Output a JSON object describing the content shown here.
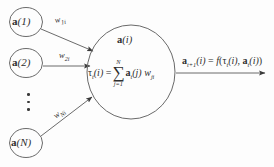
{
  "diagram": {
    "stroke_color": "#555555",
    "text_color": "#2e2e2e",
    "background": "#fdfdfd",
    "input_nodes": [
      {
        "id": "node-1",
        "label_prefix": "a",
        "label_arg": "(1)",
        "cx": 26,
        "cy": 22,
        "r": 16
      },
      {
        "id": "node-2",
        "label_prefix": "a",
        "label_arg": "(2)",
        "cx": 26,
        "cy": 63,
        "r": 16
      },
      {
        "id": "node-n",
        "label_prefix": "a",
        "label_arg": "(N)",
        "cx": 26,
        "cy": 143,
        "r": 16
      }
    ],
    "weights": [
      {
        "id": "weight-1i",
        "base": "w",
        "sub": "1i",
        "x": 58,
        "y": 22
      },
      {
        "id": "weight-2i",
        "base": "w",
        "sub": "2i",
        "x": 60,
        "y": 56
      },
      {
        "id": "weight-Ni",
        "base": "w",
        "sub": "Ni",
        "x": 58,
        "y": 110
      }
    ],
    "ellipsis_count": 3,
    "cell": {
      "cx": 131,
      "cy": 72,
      "rx": 44,
      "ry": 47,
      "top_label_prefix": "a",
      "top_label_arg": "(i)",
      "formula": {
        "lhs_tau": "τ",
        "lhs_sub": "t",
        "lhs_arg": "(i)",
        "equals": "=",
        "sigma": "∑",
        "sigma_top": "N",
        "sigma_bottom": "j=1",
        "term_a": "a",
        "term_a_sub": "t",
        "term_a_arg": "(j)",
        "term_w": "w",
        "term_w_sub": "ji"
      }
    },
    "output": {
      "a_symbol": "a",
      "a_sub": "t+1",
      "a_arg": "(i)",
      "equals": "=",
      "f_symbol": "f",
      "open_paren": "(",
      "tau_symbol": "τ",
      "tau_sub": "t",
      "tau_arg": "(i)",
      "comma": ",",
      "a2_symbol": "a",
      "a2_sub": "t",
      "a2_arg": "(i)",
      "close_paren": ")"
    }
  }
}
